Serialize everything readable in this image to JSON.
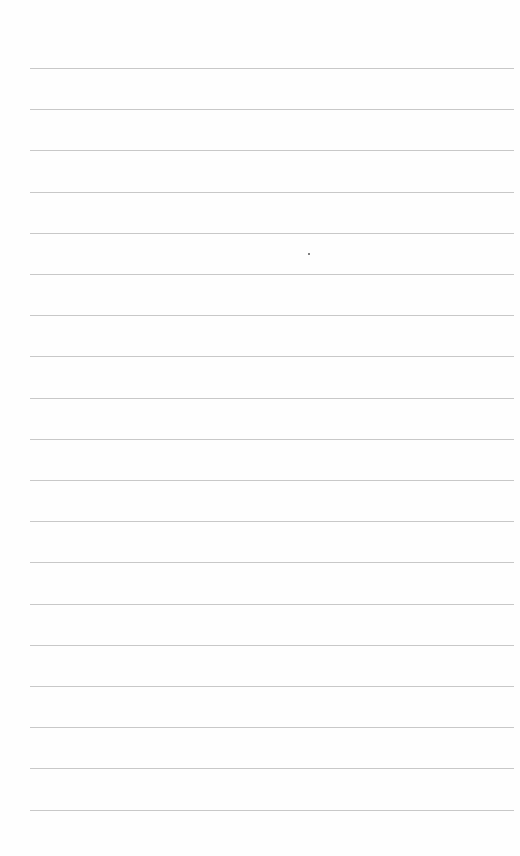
{
  "page": {
    "type": "lined-paper",
    "background": "#fefefe",
    "rule_color": "#c8c8c8",
    "rule_count": 19,
    "first_rule_y": 68,
    "rule_spacing": 41.2,
    "rule_left": 30,
    "rule_width": 484,
    "marks": [
      {
        "x": 308,
        "y": 253
      }
    ]
  }
}
